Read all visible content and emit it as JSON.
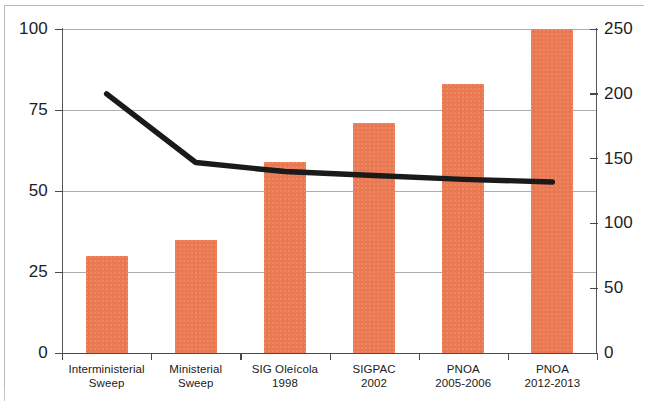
{
  "chart_data": {
    "type": "bar",
    "title": "",
    "subtitle": "",
    "xlabel": "",
    "ylabel": "",
    "grid": true,
    "legend": "none",
    "categories": [
      "Interministerial\nSweep",
      "Ministerial\nSweep",
      "SIG Oleícola\n1998",
      "SIGPAC\n2002",
      "PNOA\n2005-2006",
      "PNOA\n2012-2013"
    ],
    "series": [
      {
        "name": "bars",
        "type": "bar",
        "axis": "left",
        "color": "#EB7A52",
        "values": [
          30,
          35,
          59,
          71,
          83,
          100
        ]
      },
      {
        "name": "line",
        "type": "line",
        "axis": "right",
        "color": "#1A1A1A",
        "values": [
          200,
          147,
          140,
          137,
          134,
          132
        ]
      }
    ],
    "left_axis": {
      "min": 0,
      "max": 100,
      "ticks": [
        "0",
        "25",
        "50",
        "75",
        "100"
      ],
      "tick_values": [
        0,
        25,
        50,
        75,
        100
      ]
    },
    "right_axis": {
      "min": 0,
      "max": 250,
      "ticks": [
        "0",
        "50",
        "100",
        "150",
        "200",
        "250"
      ],
      "tick_values": [
        0,
        50,
        100,
        150,
        200,
        250
      ]
    }
  },
  "axes": {
    "left_ticks": [
      {
        "label": "100",
        "value": 100
      },
      {
        "label": "75",
        "value": 75
      },
      {
        "label": "50",
        "value": 50
      },
      {
        "label": "25",
        "value": 25
      },
      {
        "label": "0",
        "value": 0
      }
    ],
    "right_ticks": [
      {
        "label": "250",
        "value": 250
      },
      {
        "label": "200",
        "value": 200
      },
      {
        "label": "150",
        "value": 150
      },
      {
        "label": "100",
        "value": 100
      },
      {
        "label": "50",
        "value": 50
      },
      {
        "label": "0",
        "value": 0
      }
    ]
  },
  "categories_display": [
    {
      "line1": "Interministerial",
      "line2": "Sweep"
    },
    {
      "line1": "Ministerial",
      "line2": "Sweep"
    },
    {
      "line1": "SIG Oleícola",
      "line2": "1998"
    },
    {
      "line1": "SIGPAC",
      "line2": "2002"
    },
    {
      "line1": "PNOA",
      "line2": "2005-2006"
    },
    {
      "line1": "PNOA",
      "line2": "2012-2013"
    }
  ],
  "colors": {
    "bar": "#EB7A52",
    "line": "#1A1A1A",
    "grid": "#9D9D9D",
    "axis": "#4A4A4A",
    "background": "#FFFFFF",
    "frame": "#BDBDBD"
  }
}
